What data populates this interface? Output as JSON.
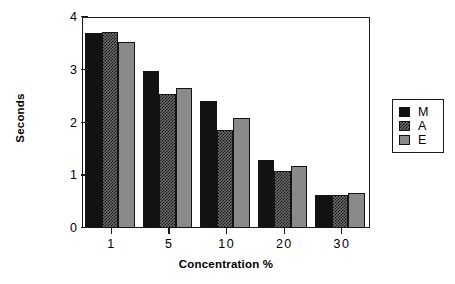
{
  "chart_data": {
    "type": "bar",
    "title": "",
    "xlabel": "Concentration %",
    "ylabel": "Seconds",
    "categories": [
      "1",
      "5",
      "10",
      "20",
      "30"
    ],
    "series": [
      {
        "name": "M",
        "values": [
          3.7,
          2.98,
          2.4,
          1.29,
          0.62
        ],
        "color": "#121212",
        "pattern": "solid-black"
      },
      {
        "name": "A",
        "values": [
          3.72,
          2.54,
          1.85,
          1.09,
          0.62
        ],
        "color": "#6e6e6e",
        "pattern": "checkerboard-hatch"
      },
      {
        "name": "E",
        "values": [
          3.52,
          2.65,
          2.08,
          1.18,
          0.67
        ],
        "color": "#8a8a8a",
        "pattern": "solid-gray"
      }
    ],
    "ylim": [
      0,
      4
    ],
    "yticks": [
      "0",
      "1",
      "2",
      "3",
      "4"
    ],
    "ytick_values": [
      0,
      1,
      2,
      3,
      4
    ],
    "xticks": [
      "1",
      "5",
      "10",
      "20",
      "30"
    ],
    "grid": false,
    "legend_position": "right",
    "legend_entries": [
      "M",
      "A",
      "E"
    ]
  },
  "axes": {
    "y_title": "Seconds",
    "x_title": "Concentration %"
  },
  "legend": {
    "items": [
      {
        "label": "M"
      },
      {
        "label": "A"
      },
      {
        "label": "E"
      }
    ]
  }
}
